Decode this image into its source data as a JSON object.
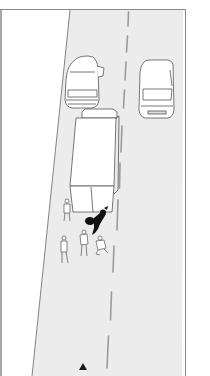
{
  "illustration": {
    "subject": "road-accident-scene",
    "colors": {
      "background": "#ffffff",
      "road": "#ececec",
      "line": "#555555",
      "frame": "#8a8a8a",
      "dashes": "#9a9a9a",
      "vehicle_fill": "#ffffff",
      "motorcycle": "#111111",
      "warning_triangle": "#1a1a1a"
    },
    "elements": [
      {
        "name": "parked-car-left",
        "description": "car parked at left edge of road, door open"
      },
      {
        "name": "car-right-lane",
        "description": "car in right lane facing viewer"
      },
      {
        "name": "box-truck",
        "description": "box truck stopped in left lane"
      },
      {
        "name": "fallen-motorcycle",
        "description": "motorcycle lying behind truck"
      },
      {
        "name": "person-standing-left",
        "description": "person standing beside truck"
      },
      {
        "name": "person-standing-rear",
        "description": "person standing at road edge"
      },
      {
        "name": "person-near-motorcycle",
        "description": "person bending near motorcycle"
      },
      {
        "name": "person-crouching",
        "description": "person crouching beside motorcycle"
      },
      {
        "name": "center-dashed-line",
        "description": "dashed lane divider"
      },
      {
        "name": "warning-triangle",
        "description": "warning triangle placed on road behind scene"
      }
    ]
  }
}
